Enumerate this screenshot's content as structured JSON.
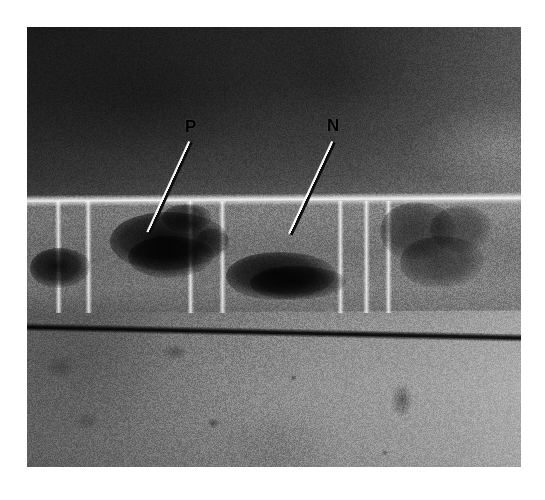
{
  "figure": {
    "kind": "photomicrograph",
    "plate": {
      "left": 27,
      "top": 27,
      "width": 494,
      "height": 440,
      "background_color": "#ffffff",
      "frame_color": "#555555"
    }
  },
  "annotations": [
    {
      "id": "label-p",
      "label": "P",
      "label_x": 185,
      "label_y": 118,
      "line": {
        "x1": 190,
        "y1": 142,
        "x2": 148,
        "y2": 233
      },
      "color": "#000000"
    },
    {
      "id": "label-n",
      "label": "N",
      "label_x": 327,
      "label_y": 117,
      "line": {
        "x1": 333,
        "y1": 142,
        "x2": 290,
        "y2": 234
      },
      "color": "#000000"
    }
  ],
  "specimen": {
    "septa_x": [
      58,
      88,
      190,
      222,
      340,
      366,
      388
    ],
    "granules": [
      {
        "x": 110,
        "y": 212,
        "w": 118,
        "h": 58,
        "dark": 0.92
      },
      {
        "x": 128,
        "y": 236,
        "w": 86,
        "h": 42,
        "dark": 0.88
      },
      {
        "x": 30,
        "y": 248,
        "w": 60,
        "h": 40,
        "dark": 0.9
      },
      {
        "x": 226,
        "y": 252,
        "w": 110,
        "h": 48,
        "dark": 0.9
      },
      {
        "x": 250,
        "y": 266,
        "w": 96,
        "h": 34,
        "dark": 0.85
      },
      {
        "x": 196,
        "y": 228,
        "w": 34,
        "h": 30,
        "dark": 0.45
      },
      {
        "x": 380,
        "y": 202,
        "w": 76,
        "h": 58,
        "dark": 0.55
      },
      {
        "x": 400,
        "y": 236,
        "w": 84,
        "h": 52,
        "dark": 0.5
      },
      {
        "x": 430,
        "y": 206,
        "w": 62,
        "h": 46,
        "dark": 0.45
      },
      {
        "x": 162,
        "y": 204,
        "w": 50,
        "h": 28,
        "dark": 0.7
      }
    ],
    "debris": [
      {
        "x": 162,
        "y": 344,
        "w": 26,
        "h": 16,
        "dark": 0.35
      },
      {
        "x": 391,
        "y": 382,
        "w": 22,
        "h": 36,
        "dark": 0.42
      },
      {
        "x": 207,
        "y": 418,
        "w": 12,
        "h": 10,
        "dark": 0.38
      },
      {
        "x": 290,
        "y": 374,
        "w": 7,
        "h": 7,
        "dark": 0.45
      },
      {
        "x": 382,
        "y": 450,
        "w": 6,
        "h": 6,
        "dark": 0.4
      },
      {
        "x": 72,
        "y": 412,
        "w": 30,
        "h": 18,
        "dark": 0.22
      },
      {
        "x": 44,
        "y": 356,
        "w": 34,
        "h": 22,
        "dark": 0.24
      },
      {
        "x": 462,
        "y": 200,
        "w": 18,
        "h": 14,
        "dark": 0.2
      }
    ]
  },
  "colors": {
    "paper": "#ffffff",
    "field_dark": "#262626",
    "field_light": "#949494",
    "wall_highlight": "#ffffff",
    "wall_shadow": "#000000",
    "annotation": "#000000"
  }
}
